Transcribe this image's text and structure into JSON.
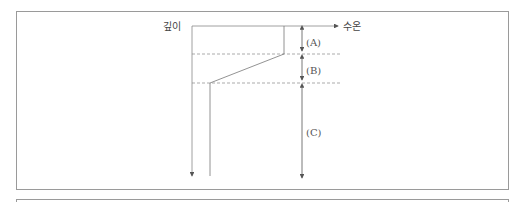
{
  "diagram": {
    "axis_labels": {
      "y": "깊이",
      "x": "수온"
    },
    "layers": [
      {
        "id": "A",
        "label": "(A)"
      },
      {
        "id": "B",
        "label": "(B)"
      },
      {
        "id": "C",
        "label": "(C)"
      }
    ],
    "colors": {
      "line": "#777777",
      "frame": "#9a9a9a",
      "text": "#444444"
    }
  }
}
